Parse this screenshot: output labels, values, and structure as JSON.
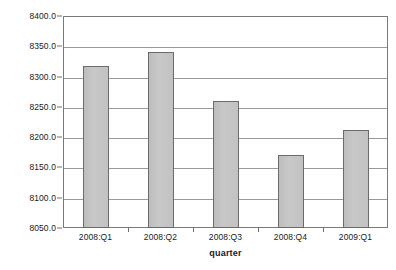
{
  "chart_data": {
    "type": "bar",
    "title": "",
    "xlabel": "quarter",
    "ylabel": "",
    "categories": [
      "2008:Q1",
      "2008:Q2",
      "2008:Q3",
      "2008:Q4",
      "2009:Q1"
    ],
    "values": [
      8317,
      8341,
      8259,
      8170,
      8212
    ],
    "ylim": [
      8050.0,
      8400.0
    ],
    "ytick_step": 50.0,
    "yticks": [
      "8050.0",
      "8100.0",
      "8150.0",
      "8200.0",
      "8250.0",
      "8300.0",
      "8350.0",
      "8400.0"
    ],
    "ytick_values": [
      8050.0,
      8100.0,
      8150.0,
      8200.0,
      8250.0,
      8300.0,
      8350.0,
      8400.0
    ],
    "grid": true,
    "legend": false,
    "series": [
      {
        "name": "",
        "values": [
          8317,
          8341,
          8259,
          8170,
          8212
        ]
      }
    ],
    "colors": {
      "bar_fill": "#c3c3c3",
      "bar_border": "#6b6b6b",
      "gridline": "#9a9a9a",
      "frame": "#7a7a7a",
      "text": "#1a1a1a",
      "background": "#ffffff"
    }
  }
}
